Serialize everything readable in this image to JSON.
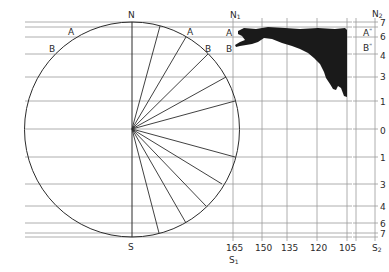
{
  "diagram": {
    "type": "map-projection-construction",
    "circle": {
      "top_label": "N",
      "bottom_label": "S",
      "left_arc_labels": [
        "A",
        "B"
      ],
      "right_arc_labels": [
        "A",
        "B"
      ]
    },
    "panel1": {
      "top_label": "N",
      "top_label_sub": "1",
      "bottom_label": "S",
      "bottom_label_sub": "1",
      "row_labels": [
        "A",
        "B"
      ],
      "x_ticks": [
        "165",
        "150",
        "135",
        "120",
        "105"
      ]
    },
    "panel2": {
      "top_label": "N",
      "top_label_sub": "2",
      "bottom_label": "S",
      "bottom_label_sub": "2",
      "row_labels": [
        "A",
        "B"
      ],
      "row_label_marks": [
        "\"",
        "\""
      ],
      "y_ticks": [
        "7",
        "6",
        "4",
        "3",
        "1",
        "0",
        "1",
        "3",
        "4",
        "6",
        "7"
      ]
    },
    "colors": {
      "ink": "#2b2b2b",
      "grid": "#9a9a9a",
      "fill": "#1a1a1a"
    }
  }
}
